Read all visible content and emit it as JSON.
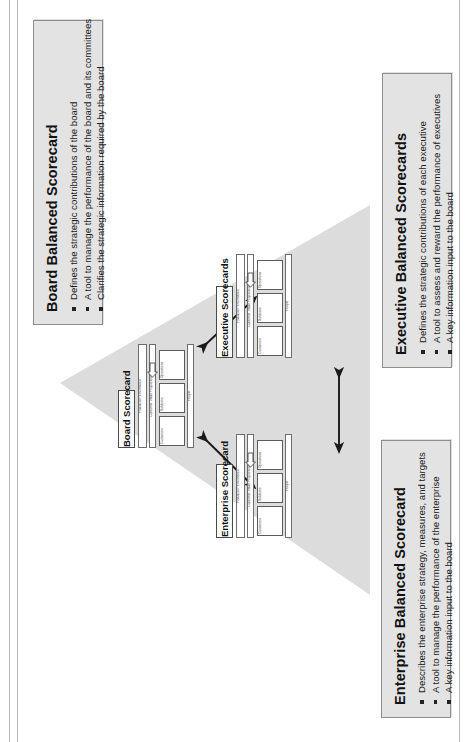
{
  "document": {
    "title": "Balanced Scorecard Hierarchy",
    "orientation": "landscape-rotated-90"
  },
  "triangle": {
    "name": "hierarchy-triangle",
    "fill": "#dcdcdc"
  },
  "callouts": [
    {
      "id": "board",
      "heading": "Board Balanced Scorecard",
      "bullets": [
        "Defines the strategic contributions of the board",
        "A tool to manage the performance of the board and its committees",
        "Clarifies the strategic information required by the board"
      ]
    },
    {
      "id": "executive",
      "heading": "Executive Balanced Scorecards",
      "bullets": [
        "Defines the strategic contributions of each executive",
        "A tool to assess and reward the performance of executives",
        "A key information input to the board"
      ]
    },
    {
      "id": "enterprise",
      "heading": "Enterprise Balanced Scorecard",
      "bullets": [
        "Describes the enterprise strategy, measures, and targets",
        "A tool to manage the performance of the enterprise",
        "A key information input to the board"
      ]
    }
  ],
  "nodes": [
    {
      "id": "board-scorecard",
      "title": "Board Scorecard",
      "bars": [
        "Financial Performance",
        "Customer Value Proposition",
        "People"
      ],
      "cells": [
        "Customers",
        "Solutions",
        "Operations"
      ]
    },
    {
      "id": "executive-scorecards",
      "title": "Executive Scorecards",
      "bars": [
        "Financial Performance",
        "Customer Value Proposition",
        "People"
      ],
      "cells": [
        "Customers",
        "Solutions",
        "Operations"
      ]
    },
    {
      "id": "enterprise-scorecard",
      "title": "Enterprise Scorecard",
      "bars": [
        "Financial Performance",
        "Customer Value Proposition",
        "People"
      ],
      "cells": [
        "Customers",
        "Solutions",
        "Operations"
      ]
    }
  ],
  "connectors": [
    {
      "id": "board-executive",
      "style": "double-headed-arrow"
    },
    {
      "id": "board-enterprise",
      "style": "double-headed-arrow"
    },
    {
      "id": "executive-enterprise",
      "style": "double-headed-arrow"
    }
  ],
  "colors": {
    "callout_fill": "#e3e3e3",
    "callout_border": "#8d8d8d",
    "triangle_fill": "#dcdcdc",
    "arrow": "#1a1a1a",
    "text": "#111111"
  }
}
